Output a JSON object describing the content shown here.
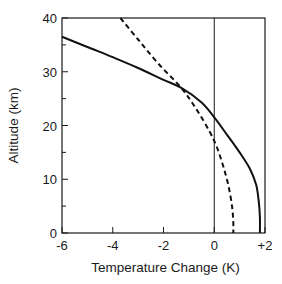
{
  "chart_data": {
    "type": "line",
    "title": "",
    "xlabel": "Temperature Change (K)",
    "ylabel": "Altitude (km)",
    "xlim": [
      -6,
      2
    ],
    "ylim": [
      0,
      40
    ],
    "x_ticks": [
      -6,
      -4,
      -2,
      0,
      2
    ],
    "x_tick_labels": [
      "-6",
      "-4",
      "-2",
      "0",
      "+2"
    ],
    "y_ticks": [
      0,
      10,
      20,
      30,
      40
    ],
    "y_tick_labels": [
      "0",
      "10",
      "20",
      "30",
      "40"
    ],
    "y_minor_ticks": [
      5,
      15,
      25,
      35
    ],
    "grid": false,
    "reference_lines": [
      {
        "axis": "x",
        "value": 0
      }
    ],
    "legend": null,
    "series": [
      {
        "name": "solid",
        "style": "solid",
        "color": "#111111",
        "points": [
          {
            "x": -6.0,
            "y": 36.5
          },
          {
            "x": -5.0,
            "y": 34.6
          },
          {
            "x": -4.0,
            "y": 32.7
          },
          {
            "x": -3.0,
            "y": 30.7
          },
          {
            "x": -2.0,
            "y": 28.5
          },
          {
            "x": -1.3,
            "y": 27.0
          },
          {
            "x": -0.5,
            "y": 24.3
          },
          {
            "x": 0.0,
            "y": 21.5
          },
          {
            "x": 0.5,
            "y": 18.3
          },
          {
            "x": 1.0,
            "y": 15.0
          },
          {
            "x": 1.4,
            "y": 12.0
          },
          {
            "x": 1.65,
            "y": 9.0
          },
          {
            "x": 1.75,
            "y": 6.0
          },
          {
            "x": 1.8,
            "y": 3.0
          },
          {
            "x": 1.8,
            "y": 0.0
          }
        ]
      },
      {
        "name": "dashed",
        "style": "dashed",
        "color": "#111111",
        "points": [
          {
            "x": -3.7,
            "y": 40.0
          },
          {
            "x": -3.0,
            "y": 36.0
          },
          {
            "x": -2.2,
            "y": 31.5
          },
          {
            "x": -1.3,
            "y": 27.0
          },
          {
            "x": -0.7,
            "y": 23.0
          },
          {
            "x": -0.2,
            "y": 19.0
          },
          {
            "x": 0.1,
            "y": 16.0
          },
          {
            "x": 0.35,
            "y": 12.5
          },
          {
            "x": 0.55,
            "y": 9.0
          },
          {
            "x": 0.7,
            "y": 5.0
          },
          {
            "x": 0.75,
            "y": 2.0
          },
          {
            "x": 0.75,
            "y": 0.0
          }
        ]
      }
    ]
  }
}
